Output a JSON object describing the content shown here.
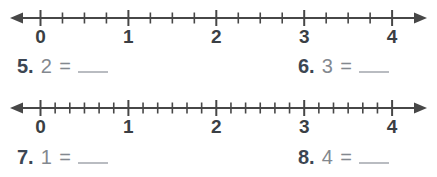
{
  "colors": {
    "background": "#ffffff",
    "line": "#474747",
    "tick": "#474747",
    "tick_label": "#3b3f44",
    "question_number": "#3c4653",
    "expression": "#83888f",
    "blank_line": "#b9bcc1"
  },
  "number_lines": [
    {
      "name": "number-line-fourths",
      "min": 0,
      "max": 4,
      "subdivisions_per_unit": 4,
      "labels": [
        "0",
        "1",
        "2",
        "3",
        "4"
      ]
    },
    {
      "name": "number-line-sixths",
      "min": 0,
      "max": 4,
      "subdivisions_per_unit": 6,
      "labels": [
        "0",
        "1",
        "2",
        "3",
        "4"
      ]
    }
  ],
  "questions": [
    {
      "number": "5.",
      "expression": "2 ="
    },
    {
      "number": "6.",
      "expression": "3 ="
    },
    {
      "number": "7.",
      "expression": "1 ="
    },
    {
      "number": "8.",
      "expression": "4 ="
    }
  ]
}
